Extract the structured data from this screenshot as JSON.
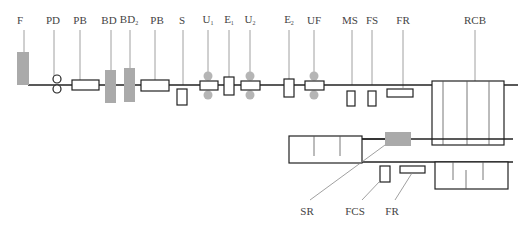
{
  "diagram": {
    "type": "process-line schematic",
    "colors": {
      "line": "#222222",
      "leader": "#888888",
      "gray_fill": "#aaaaaa",
      "text": "#444444"
    },
    "top_labels": [
      {
        "id": "F",
        "text": "F",
        "sub": ""
      },
      {
        "id": "PD",
        "text": "PD",
        "sub": ""
      },
      {
        "id": "PB1",
        "text": "PB",
        "sub": ""
      },
      {
        "id": "BD1",
        "text": "BD",
        "sub": ""
      },
      {
        "id": "BD2",
        "text": "BD",
        "sub": "2"
      },
      {
        "id": "PB2",
        "text": "PB",
        "sub": ""
      },
      {
        "id": "S",
        "text": "S",
        "sub": ""
      },
      {
        "id": "U1",
        "text": "U",
        "sub": "1"
      },
      {
        "id": "E1",
        "text": "E",
        "sub": "1"
      },
      {
        "id": "U2",
        "text": "U",
        "sub": "2"
      },
      {
        "id": "E2",
        "text": "E",
        "sub": "2"
      },
      {
        "id": "UF",
        "text": "UF",
        "sub": ""
      },
      {
        "id": "MS",
        "text": "MS",
        "sub": ""
      },
      {
        "id": "FS",
        "text": "FS",
        "sub": ""
      },
      {
        "id": "FR1",
        "text": "FR",
        "sub": ""
      },
      {
        "id": "RCB",
        "text": "RCB",
        "sub": ""
      }
    ],
    "bottom_labels": [
      {
        "id": "SR",
        "text": "SR"
      },
      {
        "id": "FCS",
        "text": "FCS"
      },
      {
        "id": "FR2",
        "text": "FR"
      }
    ]
  }
}
